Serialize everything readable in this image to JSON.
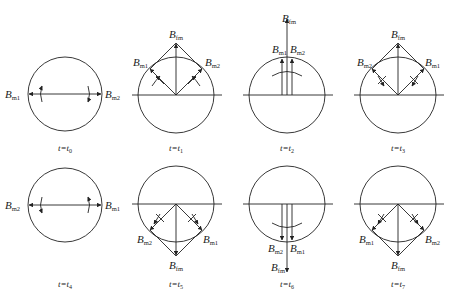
{
  "figure": {
    "colors": {
      "stroke": "#222222",
      "background": "#ffffff"
    },
    "panels": [
      {
        "id": "t0",
        "time_label": "t=t",
        "time_sub": "0",
        "state": "horizontal-opposed",
        "labels": {
          "left": {
            "B": "B",
            "sub": "m1"
          },
          "right": {
            "B": "B",
            "sub": "m2"
          }
        }
      },
      {
        "id": "t1",
        "time_label": "t=t",
        "time_sub": "1",
        "state": "up-diagonal",
        "labels": {
          "top": {
            "B": "B",
            "sub": "fm"
          },
          "left": {
            "B": "B",
            "sub": "m1"
          },
          "right": {
            "B": "B",
            "sub": "m2"
          }
        }
      },
      {
        "id": "t2",
        "time_label": "t=t",
        "time_sub": "2",
        "state": "up-aligned",
        "labels": {
          "top": {
            "B": "B",
            "sub": "fm"
          },
          "left": {
            "B": "B",
            "sub": "m1"
          },
          "right": {
            "B": "B",
            "sub": "m2"
          }
        }
      },
      {
        "id": "t3",
        "time_label": "t=t",
        "time_sub": "3",
        "state": "up-diagonal-swapped",
        "labels": {
          "top": {
            "B": "B",
            "sub": "fm"
          },
          "left": {
            "B": "B",
            "sub": "m2"
          },
          "right": {
            "B": "B",
            "sub": "m1"
          }
        }
      },
      {
        "id": "t4",
        "time_label": "t=t",
        "time_sub": "4",
        "state": "horizontal-opposed-swapped",
        "labels": {
          "left": {
            "B": "B",
            "sub": "m2"
          },
          "right": {
            "B": "B",
            "sub": "m1"
          }
        }
      },
      {
        "id": "t5",
        "time_label": "t=t",
        "time_sub": "5",
        "state": "down-diagonal",
        "labels": {
          "bottom": {
            "B": "B",
            "sub": "fm"
          },
          "left": {
            "B": "B",
            "sub": "m2"
          },
          "right": {
            "B": "B",
            "sub": "m1"
          }
        }
      },
      {
        "id": "t6",
        "time_label": "t=t",
        "time_sub": "6",
        "state": "down-aligned",
        "labels": {
          "bottom": {
            "B": "B",
            "sub": "fm"
          },
          "left": {
            "B": "B",
            "sub": "m2"
          },
          "right": {
            "B": "B",
            "sub": "m1"
          }
        }
      },
      {
        "id": "t7",
        "time_label": "t=t",
        "time_sub": "7",
        "state": "down-diagonal-swapped",
        "labels": {
          "bottom": {
            "B": "B",
            "sub": "fm"
          },
          "left": {
            "B": "B",
            "sub": "m1"
          },
          "right": {
            "B": "B",
            "sub": "m2"
          }
        }
      }
    ]
  }
}
